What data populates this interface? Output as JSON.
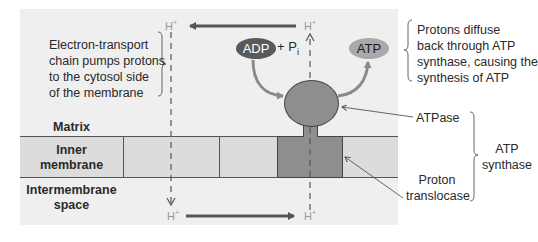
{
  "diagram": {
    "regions": {
      "matrix": "Matrix",
      "inner_membrane_line1": "Inner",
      "inner_membrane_line2": "membrane",
      "intermembrane_line1": "Intermembrane",
      "intermembrane_line2": "space"
    },
    "molecules": {
      "adp": "ADP",
      "plus_pi": "+ P",
      "pi_sub": "i",
      "atp": "ATP"
    },
    "protons": {
      "symbol": "H",
      "charge": "+"
    },
    "annotations": {
      "etc": [
        "Electron-transport",
        "chain pumps protons",
        "to the cytosol side",
        "of the membrane"
      ],
      "diffuse": [
        "Protons diffuse",
        "back through ATP",
        "synthase, causing the",
        "synthesis of ATP"
      ],
      "atpase": "ATPase",
      "translocase_line1": "Proton",
      "translocase_line2": "translocase",
      "synthase_line1": "ATP",
      "synthase_line2": "synthase"
    },
    "colors": {
      "panel": "#efefef",
      "membrane": "#dcdcdc",
      "enzyme": "#8e8e8e",
      "adp": "#595959",
      "atp": "#a9a9a9",
      "arrow": "#555555",
      "proton_text": "#999999"
    }
  }
}
